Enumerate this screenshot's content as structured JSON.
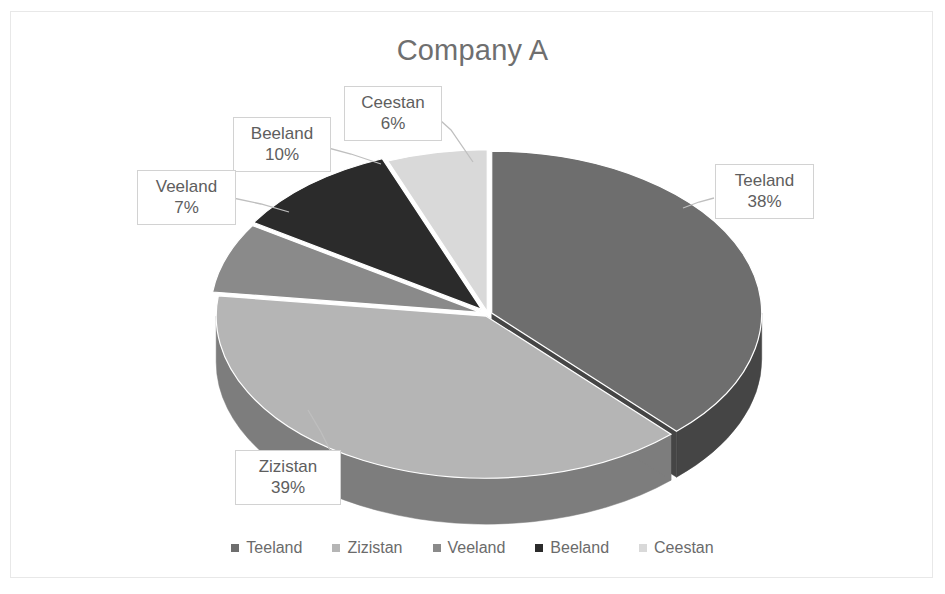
{
  "chart": {
    "title": "Company A",
    "frame_border_color": "#e8e8e8",
    "title_color": "#6f6f6f",
    "label_text_color": "#5e5e5e",
    "label_border_color": "#d2d2d2",
    "legend_text_color": "#6b6b6b",
    "leader_line_color": "#bfbfbf"
  },
  "chart_data": {
    "type": "pie",
    "title": "Company A",
    "xlabel": "",
    "ylabel": "",
    "three_d": true,
    "legend_position": "bottom",
    "grid": false,
    "categories": [
      "Teeland",
      "Zizistan",
      "Veeland",
      "Beeland",
      "Ceestan"
    ],
    "values": [
      38,
      39,
      7,
      10,
      6
    ],
    "value_unit": "%",
    "colors": [
      "#6e6e6e",
      "#b5b5b5",
      "#8a8a8a",
      "#2b2b2b",
      "#d9d9d9"
    ],
    "slices": [
      {
        "label": "Teeland",
        "value": 38,
        "display": "38%",
        "color": "#6e6e6e",
        "side_color": "#454545"
      },
      {
        "label": "Zizistan",
        "value": 39,
        "display": "39%",
        "color": "#b5b5b5",
        "side_color": "#7d7d7d"
      },
      {
        "label": "Veeland",
        "value": 7,
        "display": "7%",
        "color": "#8a8a8a",
        "side_color": "#5c5c5c"
      },
      {
        "label": "Beeland",
        "value": 10,
        "display": "10%",
        "color": "#2b2b2b",
        "side_color": "#1a1a1a"
      },
      {
        "label": "Ceestan",
        "value": 6,
        "display": "6%",
        "color": "#d9d9d9",
        "side_color": "#9a9a9a"
      }
    ]
  },
  "labels": {
    "ceestan": {
      "name": "Ceestan",
      "value": "6%"
    },
    "beeland": {
      "name": "Beeland",
      "value": "10%"
    },
    "veeland": {
      "name": "Veeland",
      "value": "7%"
    },
    "teeland": {
      "name": "Teeland",
      "value": "38%"
    },
    "zizistan": {
      "name": "Zizistan",
      "value": "39%"
    }
  },
  "legend": {
    "items": [
      {
        "label": "Teeland",
        "color": "#6e6e6e"
      },
      {
        "label": "Zizistan",
        "color": "#b5b5b5"
      },
      {
        "label": "Veeland",
        "color": "#8a8a8a"
      },
      {
        "label": "Beeland",
        "color": "#2b2b2b"
      },
      {
        "label": "Ceestan",
        "color": "#d9d9d9"
      }
    ]
  }
}
